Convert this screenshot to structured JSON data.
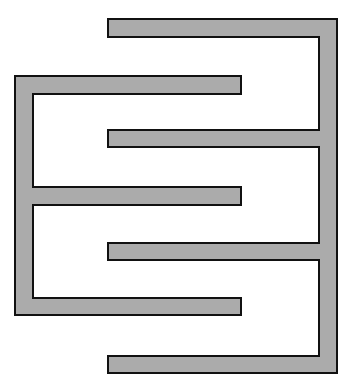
{
  "diagram": {
    "title": "",
    "colors": {
      "fill": "#ababab",
      "stroke": "#111111",
      "background": "#ffffff"
    },
    "left_comb": {
      "name": "left-electrode",
      "spine": {
        "x": 15,
        "width": 18,
        "y_top": 76,
        "y_bottom": 315
      },
      "fingers": [
        {
          "y": 76,
          "height": 18,
          "x_end": 241
        },
        {
          "y": 187,
          "height": 18,
          "x_end": 241
        },
        {
          "y": 298,
          "height": 17,
          "x_end": 241
        }
      ]
    },
    "right_comb": {
      "name": "right-electrode",
      "spine": {
        "x": 319,
        "width": 18,
        "y_top": 19,
        "y_bottom": 373
      },
      "fingers": [
        {
          "y": 19,
          "height": 18,
          "x_start": 108
        },
        {
          "y": 130,
          "height": 17,
          "x_start": 108
        },
        {
          "y": 243,
          "height": 17,
          "x_start": 108
        },
        {
          "y": 356,
          "height": 17,
          "x_start": 108
        }
      ]
    }
  }
}
